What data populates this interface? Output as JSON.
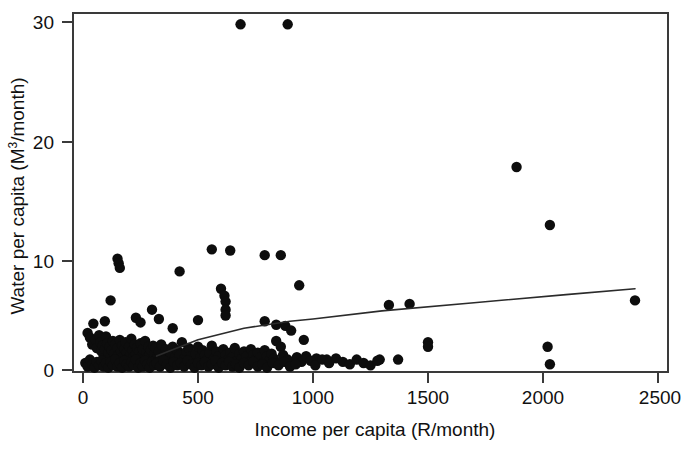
{
  "figure": {
    "kind": "scatter-plot",
    "background_color": "#ffffff",
    "marker_color": "#0d0d0d",
    "line_color": "#2b2b2b",
    "axis_color": "#3a3a3a"
  },
  "axes": {
    "x_title": "Income per capita  (R/month)",
    "y_title_main": "Water per capita (M",
    "y_title_sup": "3",
    "y_title_tail": "/month)",
    "y_title_full": "Water per capita (M3/month)",
    "x_ticks": [
      "0",
      "500",
      "1000",
      "1500",
      "2000",
      "2500"
    ],
    "y_ticks": [
      "0",
      "10",
      "20",
      "30"
    ]
  },
  "chart_data": {
    "type": "scatter",
    "title": "",
    "xlabel": "Income per capita  (R/month)",
    "ylabel": "Water per capita (M3/month)",
    "xlim": [
      0,
      2500
    ],
    "ylim": [
      0,
      30
    ],
    "xticks": [
      0,
      500,
      1000,
      1500,
      2000,
      2500
    ],
    "yticks": [
      0,
      10,
      20,
      30
    ],
    "grid": false,
    "legend": "none",
    "series": [
      {
        "name": "households",
        "marker": "filled-circle",
        "color": "#0d0d0d",
        "points": [
          [
            685,
            29.8
          ],
          [
            890,
            29.8
          ],
          [
            1885,
            17.5
          ],
          [
            2030,
            12.5
          ],
          [
            150,
            9.6
          ],
          [
            155,
            9.2
          ],
          [
            160,
            8.8
          ],
          [
            420,
            8.5
          ],
          [
            560,
            10.4
          ],
          [
            640,
            10.3
          ],
          [
            790,
            9.9
          ],
          [
            860,
            9.9
          ],
          [
            600,
            7.0
          ],
          [
            615,
            6.4
          ],
          [
            620,
            5.9
          ],
          [
            620,
            5.2
          ],
          [
            620,
            4.7
          ],
          [
            940,
            7.3
          ],
          [
            1330,
            5.6
          ],
          [
            1420,
            5.7
          ],
          [
            2400,
            6.0
          ],
          [
            120,
            6.0
          ],
          [
            95,
            4.2
          ],
          [
            45,
            4.0
          ],
          [
            230,
            4.5
          ],
          [
            250,
            4.1
          ],
          [
            300,
            5.2
          ],
          [
            330,
            4.4
          ],
          [
            390,
            3.6
          ],
          [
            500,
            4.3
          ],
          [
            790,
            4.2
          ],
          [
            840,
            3.9
          ],
          [
            880,
            3.8
          ],
          [
            905,
            3.4
          ],
          [
            960,
            2.6
          ],
          [
            840,
            2.5
          ],
          [
            860,
            2.0
          ],
          [
            1015,
            1.0
          ],
          [
            1060,
            0.9
          ],
          [
            1290,
            0.9
          ],
          [
            1370,
            0.9
          ],
          [
            1500,
            2.4
          ],
          [
            1500,
            2.0
          ],
          [
            2020,
            2.0
          ],
          [
            2030,
            0.5
          ],
          [
            20,
            3.2
          ],
          [
            30,
            2.8
          ],
          [
            40,
            2.2
          ],
          [
            55,
            2.6
          ],
          [
            60,
            1.9
          ],
          [
            70,
            3.0
          ],
          [
            75,
            2.4
          ],
          [
            80,
            1.6
          ],
          [
            85,
            2.1
          ],
          [
            90,
            1.3
          ],
          [
            95,
            1.8
          ],
          [
            100,
            2.9
          ],
          [
            105,
            2.3
          ],
          [
            110,
            1.5
          ],
          [
            115,
            2.0
          ],
          [
            120,
            1.1
          ],
          [
            125,
            1.7
          ],
          [
            130,
            2.5
          ],
          [
            135,
            1.4
          ],
          [
            140,
            2.2
          ],
          [
            145,
            1.0
          ],
          [
            150,
            1.9
          ],
          [
            155,
            1.3
          ],
          [
            160,
            2.6
          ],
          [
            165,
            1.6
          ],
          [
            170,
            2.1
          ],
          [
            175,
            1.2
          ],
          [
            180,
            1.8
          ],
          [
            185,
            2.4
          ],
          [
            190,
            1.5
          ],
          [
            195,
            1.0
          ],
          [
            200,
            2.0
          ],
          [
            205,
            1.3
          ],
          [
            210,
            2.7
          ],
          [
            215,
            1.7
          ],
          [
            220,
            1.1
          ],
          [
            225,
            2.2
          ],
          [
            230,
            1.4
          ],
          [
            235,
            1.9
          ],
          [
            240,
            0.9
          ],
          [
            245,
            1.6
          ],
          [
            250,
            2.3
          ],
          [
            255,
            1.2
          ],
          [
            260,
            1.8
          ],
          [
            265,
            1.0
          ],
          [
            270,
            2.5
          ],
          [
            275,
            1.5
          ],
          [
            280,
            1.1
          ],
          [
            285,
            2.0
          ],
          [
            290,
            1.3
          ],
          [
            295,
            1.7
          ],
          [
            300,
            0.8
          ],
          [
            305,
            2.1
          ],
          [
            310,
            1.4
          ],
          [
            315,
            1.9
          ],
          [
            320,
            1.0
          ],
          [
            330,
            1.6
          ],
          [
            340,
            2.2
          ],
          [
            350,
            1.2
          ],
          [
            360,
            1.8
          ],
          [
            370,
            0.9
          ],
          [
            380,
            1.5
          ],
          [
            390,
            2.0
          ],
          [
            400,
            1.1
          ],
          [
            410,
            1.7
          ],
          [
            420,
            1.3
          ],
          [
            430,
            2.4
          ],
          [
            440,
            1.0
          ],
          [
            450,
            1.6
          ],
          [
            460,
            1.9
          ],
          [
            470,
            1.2
          ],
          [
            480,
            0.8
          ],
          [
            490,
            1.4
          ],
          [
            500,
            2.0
          ],
          [
            510,
            1.1
          ],
          [
            520,
            1.7
          ],
          [
            530,
            1.3
          ],
          [
            540,
            0.9
          ],
          [
            550,
            1.5
          ],
          [
            560,
            2.1
          ],
          [
            570,
            1.0
          ],
          [
            580,
            1.6
          ],
          [
            590,
            1.2
          ],
          [
            600,
            0.7
          ],
          [
            610,
            1.8
          ],
          [
            620,
            1.3
          ],
          [
            630,
            0.9
          ],
          [
            640,
            1.5
          ],
          [
            650,
            1.1
          ],
          [
            660,
            1.9
          ],
          [
            670,
            0.8
          ],
          [
            680,
            1.4
          ],
          [
            690,
            1.0
          ],
          [
            700,
            1.6
          ],
          [
            710,
            1.2
          ],
          [
            720,
            0.7
          ],
          [
            730,
            1.8
          ],
          [
            740,
            1.3
          ],
          [
            750,
            0.9
          ],
          [
            760,
            1.5
          ],
          [
            770,
            1.1
          ],
          [
            780,
            0.6
          ],
          [
            790,
            1.7
          ],
          [
            800,
            1.2
          ],
          [
            810,
            0.8
          ],
          [
            820,
            1.4
          ],
          [
            830,
            1.0
          ],
          [
            850,
            0.6
          ],
          [
            870,
            1.3
          ],
          [
            890,
            0.9
          ],
          [
            910,
            0.5
          ],
          [
            930,
            1.1
          ],
          [
            950,
            0.7
          ],
          [
            970,
            1.2
          ],
          [
            990,
            0.8
          ],
          [
            1010,
            0.4
          ],
          [
            1040,
            0.9
          ],
          [
            1070,
            0.6
          ],
          [
            1100,
            1.0
          ],
          [
            1130,
            0.7
          ],
          [
            1160,
            0.5
          ],
          [
            1190,
            0.9
          ],
          [
            1220,
            0.6
          ],
          [
            1250,
            0.4
          ],
          [
            1280,
            0.8
          ],
          [
            10,
            0.6
          ],
          [
            20,
            0.3
          ],
          [
            30,
            0.9
          ],
          [
            40,
            0.5
          ],
          [
            50,
            0.2
          ],
          [
            60,
            0.7
          ],
          [
            70,
            0.4
          ],
          [
            80,
            0.8
          ],
          [
            90,
            0.3
          ],
          [
            100,
            0.6
          ],
          [
            110,
            0.2
          ],
          [
            120,
            0.7
          ],
          [
            130,
            0.4
          ],
          [
            140,
            0.9
          ],
          [
            150,
            0.3
          ],
          [
            160,
            0.6
          ],
          [
            170,
            0.2
          ],
          [
            180,
            0.8
          ],
          [
            190,
            0.5
          ],
          [
            200,
            0.3
          ],
          [
            210,
            0.7
          ],
          [
            220,
            0.4
          ],
          [
            230,
            0.9
          ],
          [
            240,
            0.2
          ],
          [
            250,
            0.6
          ],
          [
            260,
            0.3
          ],
          [
            270,
            0.8
          ],
          [
            280,
            0.5
          ],
          [
            290,
            0.2
          ],
          [
            300,
            0.7
          ],
          [
            310,
            0.4
          ],
          [
            320,
            0.6
          ],
          [
            335,
            0.3
          ],
          [
            350,
            0.8
          ],
          [
            365,
            0.5
          ],
          [
            380,
            0.2
          ],
          [
            395,
            0.7
          ],
          [
            410,
            0.4
          ],
          [
            425,
            0.6
          ],
          [
            440,
            0.3
          ],
          [
            455,
            0.8
          ],
          [
            470,
            0.5
          ],
          [
            485,
            0.2
          ],
          [
            500,
            0.6
          ],
          [
            515,
            0.4
          ],
          [
            530,
            0.7
          ],
          [
            545,
            0.3
          ],
          [
            560,
            0.5
          ],
          [
            575,
            0.8
          ],
          [
            590,
            0.2
          ],
          [
            605,
            0.6
          ],
          [
            620,
            0.4
          ],
          [
            635,
            0.7
          ],
          [
            650,
            0.3
          ],
          [
            665,
            0.5
          ],
          [
            680,
            0.2
          ],
          [
            700,
            0.6
          ],
          [
            720,
            0.4
          ],
          [
            740,
            0.7
          ],
          [
            760,
            0.3
          ],
          [
            780,
            0.5
          ],
          [
            800,
            0.2
          ],
          [
            825,
            0.6
          ],
          [
            850,
            0.4
          ],
          [
            875,
            0.7
          ],
          [
            900,
            0.3
          ],
          [
            925,
            0.5
          ]
        ]
      }
    ],
    "fit_line": {
      "name": "smoothed trend",
      "color": "#2b2b2b",
      "points": [
        [
          320,
          1.2
        ],
        [
          500,
          2.6
        ],
        [
          700,
          3.6
        ],
        [
          900,
          4.2
        ],
        [
          1000,
          4.4
        ],
        [
          1300,
          5.1
        ],
        [
          1700,
          5.8
        ],
        [
          2100,
          6.5
        ],
        [
          2400,
          7.0
        ]
      ]
    }
  }
}
